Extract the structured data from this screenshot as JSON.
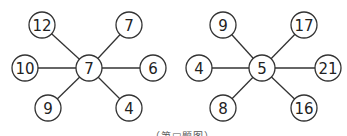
{
  "figures": [
    {
      "name": "left-star",
      "center": {
        "value": "7",
        "x": 89,
        "y": 68
      },
      "outer": [
        {
          "value": "12",
          "x": 42,
          "y": 25
        },
        {
          "value": "7",
          "x": 129,
          "y": 25
        },
        {
          "value": "10",
          "x": 25,
          "y": 68
        },
        {
          "value": "6",
          "x": 153,
          "y": 68
        },
        {
          "value": "9",
          "x": 48,
          "y": 108
        },
        {
          "value": "4",
          "x": 129,
          "y": 108
        }
      ]
    },
    {
      "name": "right-star",
      "center": {
        "value": "5",
        "x": 262,
        "y": 68
      },
      "outer": [
        {
          "value": "9",
          "x": 223,
          "y": 25
        },
        {
          "value": "17",
          "x": 304,
          "y": 25
        },
        {
          "value": "4",
          "x": 199,
          "y": 68
        },
        {
          "value": "21",
          "x": 328,
          "y": 68
        },
        {
          "value": "8",
          "x": 223,
          "y": 108
        },
        {
          "value": "16",
          "x": 304,
          "y": 108
        }
      ]
    }
  ],
  "style": {
    "line_color": "#333333",
    "node_radius": 13
  },
  "caption": "（第□题图）"
}
